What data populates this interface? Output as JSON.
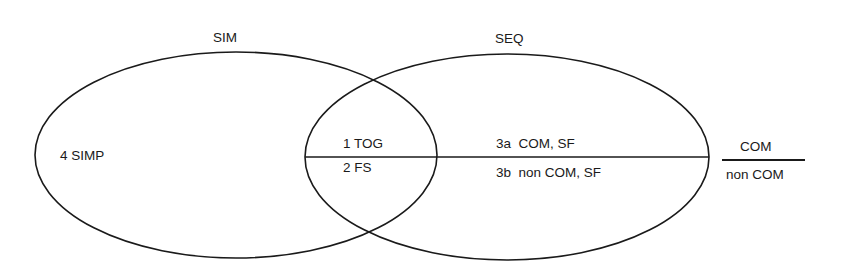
{
  "diagram": {
    "sets": {
      "sim": {
        "label": "SIM"
      },
      "seq": {
        "label": "SEQ"
      }
    },
    "regions": {
      "simp": {
        "label": "4 SIMP"
      },
      "tog": {
        "label": "1 TOG"
      },
      "fs": {
        "label": "2 FS"
      },
      "com_sf": {
        "label": "3a  COM, SF"
      },
      "noncom_sf": {
        "label": "3b  non COM, SF"
      }
    },
    "legend": {
      "numerator": "COM",
      "denominator": "non COM"
    },
    "colors": {
      "line": "#1a1a1a",
      "background": "#ffffff"
    }
  }
}
